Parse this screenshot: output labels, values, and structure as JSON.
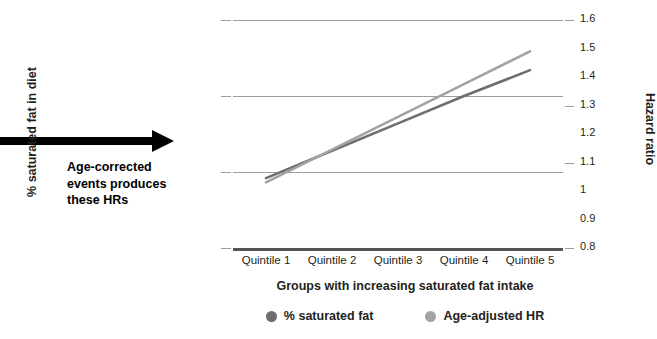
{
  "annotation": {
    "line1": "Age-corrected",
    "line2": "events produces",
    "line3": "these HRs",
    "arrow_name": "rightward-arrow"
  },
  "chart_data": {
    "type": "line",
    "title": "",
    "xlabel": "Groups with increasing saturated fat intake",
    "ylabel": "% saturated fat in diet",
    "y2label": "Hazard ratio",
    "categories": [
      "Quintile 1",
      "Quintile 2",
      "Quintile 3",
      "Quintile 4",
      "Quintile 5"
    ],
    "x": [
      1,
      2,
      3,
      4,
      5
    ],
    "grid": true,
    "legend_position": "bottom",
    "ylim": [
      5,
      20
    ],
    "yticks": [
      5,
      10,
      15,
      20
    ],
    "ytick_labels": [
      "5%",
      "10%",
      "15%",
      "20%"
    ],
    "y2lim": [
      0.8,
      1.6
    ],
    "y2ticks": [
      0.8,
      0.9,
      1.0,
      1.1,
      1.2,
      1.3,
      1.4,
      1.5,
      1.6
    ],
    "y2tick_labels": [
      "0.8",
      "0.9",
      "1",
      "1.1",
      "1.2",
      "1.3",
      "1.4",
      "1.5",
      "1.6"
    ],
    "series": [
      {
        "name": "% saturated fat",
        "axis": "left",
        "color": "#6e6e6e",
        "values": [
          9.6,
          11.4,
          13.2,
          15.0,
          16.7
        ]
      },
      {
        "name": "Age-adjusted HR",
        "axis": "right",
        "color": "#a3a3a3",
        "values": [
          1.03,
          1.145,
          1.26,
          1.375,
          1.49
        ]
      }
    ]
  },
  "legend": [
    {
      "label": "% saturated fat",
      "color": "#6e6e6e"
    },
    {
      "label": "Age-adjusted HR",
      "color": "#a3a3a3"
    }
  ],
  "colors": {
    "gridline": "#9d9d9d",
    "axis": "#555555",
    "text": "#231f20",
    "arrow": "#000000"
  }
}
